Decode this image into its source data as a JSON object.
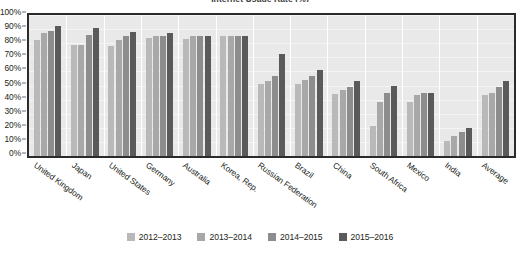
{
  "chart_data": {
    "type": "bar",
    "title": "Internet Usage Rate (%)",
    "xlabel": "",
    "ylabel": "",
    "ylim": [
      0,
      100
    ],
    "grid": true,
    "legend_position": "bottom",
    "categories": [
      "United Kingdom",
      "Japan",
      "United States",
      "Germany",
      "Australia",
      "Korea, Rep.",
      "Russian Federation",
      "Brazil",
      "China",
      "South Africa",
      "Mexico",
      "India",
      "Average"
    ],
    "ytick_labels": [
      "100%",
      "90%",
      "80%",
      "70%",
      "60%",
      "50%",
      "40%",
      "30%",
      "20%",
      "10%",
      "0%"
    ],
    "ytick_values": [
      100,
      90,
      80,
      70,
      60,
      50,
      40,
      30,
      20,
      10,
      0
    ],
    "series": [
      {
        "name": "2012–2013",
        "color": "#b9b9b9",
        "values": [
          82,
          79,
          78,
          84,
          83,
          85,
          51,
          51,
          44,
          21,
          38,
          11,
          43
        ]
      },
      {
        "name": "2013–2014",
        "color": "#a8a8a8",
        "values": [
          87,
          79,
          82,
          85,
          85,
          85,
          53,
          54,
          47,
          38,
          43,
          14,
          45
        ]
      },
      {
        "name": "2014–2015",
        "color": "#8d8d8d",
        "values": [
          89,
          86,
          85,
          85,
          85,
          85,
          57,
          57,
          49,
          45,
          45,
          17,
          49
        ]
      },
      {
        "name": "2015–2016",
        "color": "#5a5a5a",
        "values": [
          92,
          91,
          88,
          87,
          85,
          85,
          72,
          61,
          53,
          50,
          45,
          20,
          53
        ]
      }
    ]
  }
}
